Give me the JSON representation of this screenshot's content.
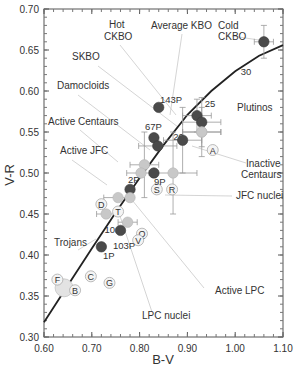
{
  "chart_data": {
    "type": "scatter",
    "title": "",
    "xlabel": "B-V",
    "ylabel": "V-R",
    "xlim": [
      0.6,
      1.1
    ],
    "ylim": [
      0.3,
      0.7
    ],
    "xticks": [
      "0.60",
      "0.70",
      "0.80",
      "0.90",
      "1.00",
      "1.10"
    ],
    "yticks": [
      "0.30",
      "0.35",
      "0.40",
      "0.45",
      "0.50",
      "0.55",
      "0.60",
      "0.65",
      "0.70"
    ],
    "grid": false,
    "reddening_curve": {
      "points": [
        [
          0.6,
          0.318
        ],
        [
          0.65,
          0.363
        ],
        [
          0.7,
          0.408
        ],
        [
          0.75,
          0.452
        ],
        [
          0.8,
          0.494
        ],
        [
          0.85,
          0.534
        ],
        [
          0.9,
          0.571
        ],
        [
          0.95,
          0.6
        ],
        [
          1.0,
          0.624
        ],
        [
          1.05,
          0.643
        ],
        [
          1.1,
          0.656
        ]
      ],
      "tick_labels": [
        {
          "label": "10",
          "x": 0.718,
          "y": 0.432
        },
        {
          "label": "20",
          "x": 0.862,
          "y": 0.545
        },
        {
          "label": "25",
          "x": 0.928,
          "y": 0.585
        },
        {
          "label": "30",
          "x": 1.003,
          "y": 0.625
        }
      ]
    },
    "series": [
      {
        "name": "Cold CKBO",
        "style": "dark",
        "x": 1.06,
        "y": 0.66,
        "xerr": 0.02,
        "yerr": 0.02
      },
      {
        "name": "Hot CKBO",
        "style": "dark",
        "x": 0.92,
        "y": 0.57,
        "xerr": 0.03,
        "yerr": 0.02
      },
      {
        "name": "Average KBO",
        "style": "dark",
        "x": 0.93,
        "y": 0.562,
        "xerr": 0.04,
        "yerr": 0.03
      },
      {
        "name": "Plutinos",
        "style": "light",
        "x": 0.93,
        "y": 0.55,
        "xerr": 0.04,
        "yerr": 0.03
      },
      {
        "name": "SKBO",
        "style": "dark",
        "x": 0.89,
        "y": 0.54,
        "xerr": 0.04,
        "yerr": 0.04
      },
      {
        "name": "143P",
        "style": "dark",
        "x": 0.84,
        "y": 0.58
      },
      {
        "name": "67P",
        "style": "dark",
        "x": 0.83,
        "y": 0.543
      },
      {
        "name": "Damocloids",
        "style": "dark",
        "x": 0.838,
        "y": 0.533,
        "xerr": 0.04
      },
      {
        "name": "Active Centaurs",
        "style": "light",
        "x": 0.81,
        "y": 0.51,
        "xerr": 0.03,
        "yerr": 0.04
      },
      {
        "name": "Active Centaurs (2)",
        "style": "light",
        "x": 0.803,
        "y": 0.5,
        "xerr": 0.03
      },
      {
        "name": "9P",
        "style": "dark",
        "x": 0.83,
        "y": 0.5
      },
      {
        "name": "JFC nuclei",
        "style": "light",
        "x": 0.87,
        "y": 0.5,
        "xerr": 0.05,
        "yerr": 0.05
      },
      {
        "name": "Inactive Centaurs",
        "style": "light",
        "x": 0.93,
        "y": 0.55,
        "xerr": 0.04
      },
      {
        "name": "2P",
        "style": "dark",
        "x": 0.78,
        "y": 0.48
      },
      {
        "name": "Active JFC",
        "style": "light",
        "x": 0.755,
        "y": 0.47,
        "xerr": 0.03
      },
      {
        "name": "Active JFC (2)",
        "style": "light",
        "x": 0.78,
        "y": 0.47
      },
      {
        "name": "Active LPC",
        "style": "light",
        "x": 0.775,
        "y": 0.44,
        "xerr": 0.02
      },
      {
        "name": "103P",
        "style": "dark",
        "x": 0.76,
        "y": 0.43
      },
      {
        "name": "Trojans",
        "style": "light",
        "x": 0.73,
        "y": 0.45,
        "xerr": 0.02
      },
      {
        "name": "1P",
        "style": "dark",
        "x": 0.72,
        "y": 0.41
      },
      {
        "name": "Sun",
        "style": "sun",
        "x": 0.642,
        "y": 0.36
      }
    ],
    "letter_markers": [
      {
        "label": "A",
        "x": 0.953,
        "y": 0.528
      },
      {
        "label": "S",
        "x": 0.836,
        "y": 0.48
      },
      {
        "label": "R",
        "x": 0.868,
        "y": 0.48
      },
      {
        "label": "D",
        "x": 0.72,
        "y": 0.462
      },
      {
        "label": "T",
        "x": 0.755,
        "y": 0.453
      },
      {
        "label": "Q",
        "x": 0.805,
        "y": 0.426
      },
      {
        "label": "V",
        "x": 0.797,
        "y": 0.418
      },
      {
        "label": "F",
        "x": 0.628,
        "y": 0.37
      },
      {
        "label": "B",
        "x": 0.665,
        "y": 0.357
      },
      {
        "label": "C",
        "x": 0.698,
        "y": 0.374
      },
      {
        "label": "G",
        "x": 0.737,
        "y": 0.366
      }
    ],
    "annotations": [
      {
        "text": "Hot",
        "px": 109,
        "py": 28
      },
      {
        "text": "CKBO",
        "px": 104,
        "py": 40
      },
      {
        "text": "Average KBO",
        "px": 151,
        "py": 29
      },
      {
        "text": "Cold",
        "px": 218,
        "py": 29
      },
      {
        "text": "CKBO",
        "px": 218,
        "py": 40
      },
      {
        "text": "SKBO",
        "px": 72,
        "py": 60
      },
      {
        "text": "Damocloids",
        "px": 57,
        "py": 89
      },
      {
        "text": "Active Centaurs",
        "px": 48,
        "py": 125
      },
      {
        "text": "Active JFC",
        "px": 60,
        "py": 154
      },
      {
        "text": "Plutinos",
        "px": 237,
        "py": 111
      },
      {
        "text": "Inactive",
        "px": 246,
        "py": 167
      },
      {
        "text": "Centaurs",
        "px": 241,
        "py": 178
      },
      {
        "text": "JFC nuclei",
        "px": 236,
        "py": 199
      },
      {
        "text": "Trojans",
        "px": 54,
        "py": 246
      },
      {
        "text": "Active LPC",
        "px": 215,
        "py": 294
      },
      {
        "text": "LPC nuclei",
        "px": 142,
        "py": 319
      }
    ]
  },
  "axes": {
    "x_title": "B-V",
    "y_title": "V-R"
  }
}
